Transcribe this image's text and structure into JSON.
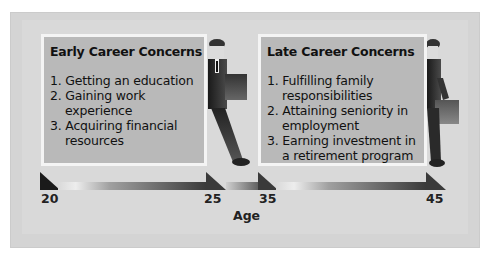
{
  "diagram": {
    "type": "career-stage timeline",
    "colors": {
      "frame_bg": "#d4d4d4",
      "box_fill": "#b9b9b9",
      "box_border": "#f4f4f4",
      "arrow_dark": "#2a2a2a",
      "text": "#111111"
    },
    "stages": [
      {
        "title": "Early Career Concerns",
        "items": [
          "1. Getting an education",
          "2. Gaining work experience",
          "3. Acquiring financial resources"
        ],
        "age_start": "20",
        "age_end": "25"
      },
      {
        "title": "Late Career Concerns",
        "items": [
          "1. Fulfilling family responsibilities",
          "2. Attaining seniority in employment",
          "3. Earning investment in a retirement program"
        ],
        "age_start": "35",
        "age_end": "45"
      }
    ],
    "axis": {
      "label": "Age",
      "ticks": [
        "20",
        "25",
        "35",
        "45"
      ]
    },
    "figures": [
      {
        "icon": "businessman-walking-icon"
      },
      {
        "icon": "businessman-walking-icon"
      }
    ]
  }
}
